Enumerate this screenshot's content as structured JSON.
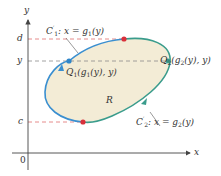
{
  "diagram": {
    "axes": {
      "x_label": "x",
      "y_label": "y",
      "origin_label": "0"
    },
    "levels": {
      "d": "d",
      "y": "y",
      "c": "c"
    },
    "region_label": "R",
    "curves": {
      "c1": {
        "name": "C",
        "prime": "′",
        "sub": "1",
        "eq": ": x = g",
        "eq_sub": "1",
        "eq_tail": "(y)"
      },
      "c2": {
        "name": "C",
        "prime": "′",
        "sub": "2",
        "eq": ": x = g",
        "eq_sub": "2",
        "eq_tail": "(y)"
      }
    },
    "points": {
      "q1": {
        "name": "Q",
        "sub": "1",
        "body": "(g",
        "g_sub": "1",
        "tail": "(y), y)"
      },
      "q2": {
        "name": "Q",
        "sub": "2",
        "body": "(g",
        "g_sub": "2",
        "tail": "(y), y)"
      }
    },
    "colors": {
      "region_fill": "#f3ecd6",
      "left_curve": "#3a8fd0",
      "right_curve": "#3a9c8c",
      "dash_red": "#e07070",
      "dash_gray": "#8a8a8a",
      "dot_red": "#d9303a",
      "dot_blue": "#2f86c9",
      "dot_green": "#3a9c8c",
      "axis": "#444444"
    }
  }
}
